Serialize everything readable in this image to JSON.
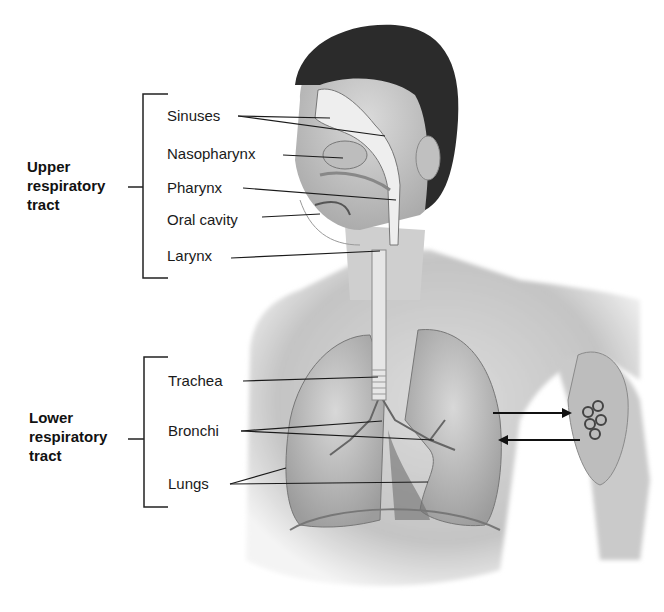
{
  "diagram": {
    "groups": [
      {
        "name": "Upper respiratory tract",
        "lines": [
          "Upper",
          "respiratory",
          "tract"
        ],
        "labels": [
          "Sinuses",
          "Nasopharynx",
          "Pharynx",
          "Oral cavity",
          "Larynx"
        ]
      },
      {
        "name": "Lower respiratory tract",
        "lines": [
          "Lower",
          "respiratory",
          "tract"
        ],
        "labels": [
          "Trachea",
          "Bronchi",
          "Lungs"
        ]
      }
    ],
    "inset": {
      "description": "Alveoli enlargement with gas exchange arrows",
      "arrows": [
        "inbound-arrow",
        "outbound-arrow"
      ]
    },
    "colors": {
      "ink": "#1a1a1a",
      "hair": "#2a2a2a",
      "skin": "#d4d4d4",
      "shade": "#9a9a9a",
      "airway": "#ececec"
    }
  }
}
